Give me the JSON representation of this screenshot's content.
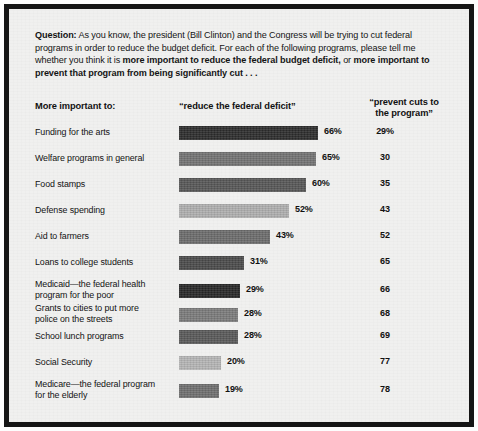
{
  "frame": {
    "border_color": "#151515",
    "background_color": "#f0f0ef"
  },
  "question": {
    "label": "Question:",
    "part1": " As you know, the president (Bill Clinton) and the Congress will be trying to cut federal programs in order to reduce the budget deficit. For each of the following programs, please tell me whether you think it is ",
    "bold1": "more important to reduce the federal budget deficit,",
    "mid": " or ",
    "bold2": "more important to prevent that program from being significantly cut . . ."
  },
  "headers": {
    "left": "More important to:",
    "middle": "“reduce the federal deficit”",
    "right_line1": "“prevent cuts to",
    "right_line2": "the program”"
  },
  "chart_data": {
    "type": "bar",
    "xlabel": "",
    "ylabel": "",
    "xlim": [
      0,
      100
    ],
    "grid": false,
    "legend_position": "none",
    "orientation": "horizontal",
    "categories": [
      "Funding for the arts",
      "Welfare programs in general",
      "Food stamps",
      "Defense spending",
      "Aid to farmers",
      "Loans to college students",
      "Medicaid—the federal health program for the poor",
      "Grants to cities to put more police on the streets",
      "School lunch programs",
      "Social Security",
      "Medicare—the federal program for the elderly"
    ],
    "series": [
      {
        "name": "“reduce the federal deficit”",
        "values": [
          66,
          65,
          60,
          52,
          43,
          31,
          29,
          28,
          28,
          20,
          19
        ]
      },
      {
        "name": "“prevent cuts to the program”",
        "values": [
          29,
          30,
          35,
          43,
          52,
          65,
          66,
          68,
          69,
          77,
          78
        ]
      }
    ]
  },
  "rows": [
    {
      "label_line1": "Funding for the arts",
      "label_line2": "",
      "two_line": false,
      "bar_value": 66,
      "bar_label": "66%",
      "bar_color": "#2c2c2c",
      "right_value": "29%"
    },
    {
      "label_line1": "Welfare programs in general",
      "label_line2": "",
      "two_line": false,
      "bar_value": 65,
      "bar_label": "65%",
      "bar_color": "#727272",
      "right_value": "30"
    },
    {
      "label_line1": "Food stamps",
      "label_line2": "",
      "two_line": false,
      "bar_value": 60,
      "bar_label": "60%",
      "bar_color": "#565656",
      "right_value": "35"
    },
    {
      "label_line1": "Defense spending",
      "label_line2": "",
      "two_line": false,
      "bar_value": 52,
      "bar_label": "52%",
      "bar_color": "#aeaeae",
      "right_value": "43"
    },
    {
      "label_line1": "Aid to farmers",
      "label_line2": "",
      "two_line": false,
      "bar_value": 43,
      "bar_label": "43%",
      "bar_color": "#6b6b6b",
      "right_value": "52"
    },
    {
      "label_line1": "Loans to college students",
      "label_line2": "",
      "two_line": false,
      "bar_value": 31,
      "bar_label": "31%",
      "bar_color": "#4a4a4a",
      "right_value": "65"
    },
    {
      "label_line1": "Medicaid—the federal health",
      "label_line2": "program for the poor",
      "two_line": true,
      "bar_value": 29,
      "bar_label": "29%",
      "bar_color": "#262626",
      "right_value": "66"
    },
    {
      "label_line1": "Grants to cities to put more",
      "label_line2": "police on the streets",
      "two_line": true,
      "bar_value": 28,
      "bar_label": "28%",
      "bar_color": "#7a7a7a",
      "right_value": "68"
    },
    {
      "label_line1": "School lunch programs",
      "label_line2": "",
      "two_line": false,
      "bar_value": 28,
      "bar_label": "28%",
      "bar_color": "#585858",
      "right_value": "69"
    },
    {
      "label_line1": "Social Security",
      "label_line2": "",
      "two_line": false,
      "bar_value": 20,
      "bar_label": "20%",
      "bar_color": "#b4b4b4",
      "right_value": "77"
    },
    {
      "label_line1": "Medicare—the federal program",
      "label_line2": "for the elderly",
      "two_line": true,
      "bar_value": 19,
      "bar_label": "19%",
      "bar_color": "#6e6e6e",
      "right_value": "78"
    }
  ],
  "scale": {
    "px_per_percent": 2.11,
    "bar_origin_x": 170
  }
}
